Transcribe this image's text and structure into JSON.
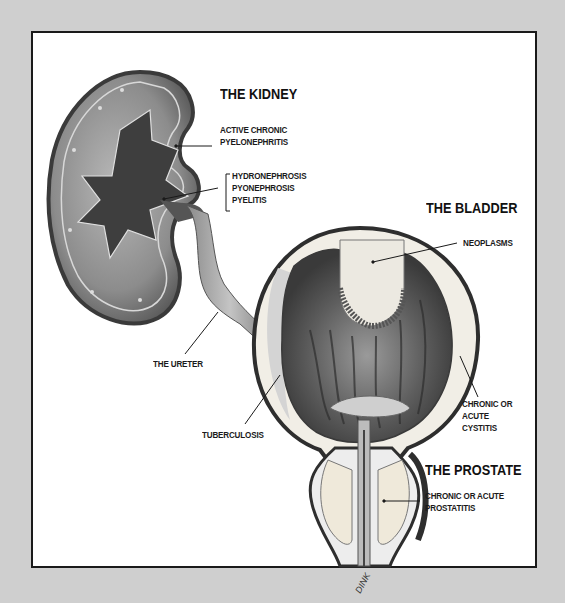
{
  "figure": {
    "headings": {
      "kidney": "THE KIDNEY",
      "bladder": "THE BLADDER",
      "prostate": "THE PROSTATE"
    },
    "labels": {
      "pyelonephritis": [
        "ACTIVE CHRONIC",
        "PYELONEPHRITIS"
      ],
      "hydronephrosis_group": [
        "HYDRONEPHROSIS",
        "PYONEPHROSIS",
        "PYELITIS"
      ],
      "ureter": "THE URETER",
      "neoplasms": "NEOPLASMS",
      "tuberculosis": "TUBERCULOSIS",
      "cystitis": [
        "CHRONIC OR",
        "ACUTE",
        "CYSTITIS"
      ],
      "prostatitis": [
        "CHRONIC OR ACUTE",
        "PROSTATITIS"
      ]
    },
    "signature": "DINK",
    "colors": {
      "background": "#cfcfcf",
      "panel": "#ffffff",
      "border": "#1a1a1a",
      "tissue_dark": "#4a4a4a",
      "tissue_mid": "#8a8a8a",
      "tissue_light": "#e6e3dc"
    }
  }
}
